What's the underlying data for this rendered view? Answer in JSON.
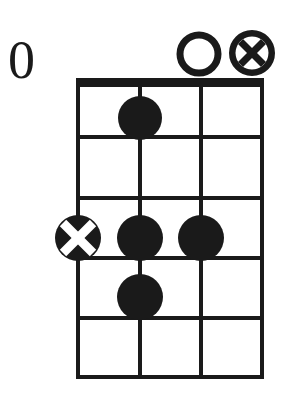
{
  "diagram": {
    "type": "chord-chart",
    "instrument_strings": 4,
    "frets_shown": 5,
    "starting_fret_label": "0",
    "colors": {
      "ink": "#1a1a1a",
      "background": "#ffffff",
      "marker_cross": "#ffffff"
    },
    "geometry": {
      "string_x": [
        78,
        140,
        201,
        262
      ],
      "fret_y": [
        86,
        137,
        198,
        258,
        318,
        378
      ],
      "nut_top": 78,
      "nut_bottom": 86,
      "dot_radius": 22,
      "open_marker_radius": 19,
      "muted_marker_radius": 20
    }
  },
  "fret_position": {
    "label": "0"
  },
  "top_markers": [
    {
      "id": "open-string-3",
      "kind": "open",
      "symbol": "O",
      "string_index": 2,
      "cx": 199,
      "cy": 54,
      "r": 19,
      "meaning": "open"
    },
    {
      "id": "muted-string-4",
      "kind": "muted",
      "symbol": "X",
      "string_index": 3,
      "cx": 252,
      "cy": 53,
      "r": 20,
      "meaning": "muted"
    }
  ],
  "finger_dots": [
    {
      "id": "dot-string2-fret1",
      "kind": "filled",
      "string_index": 1,
      "fret": 1,
      "cx": 140,
      "cy": 118,
      "r": 22
    },
    {
      "id": "dot-string1-fret3-crossed",
      "kind": "crossed",
      "string_index": 0,
      "fret": 3,
      "cx": 78,
      "cy": 238,
      "r": 23
    },
    {
      "id": "dot-string2-fret3",
      "kind": "filled",
      "string_index": 1,
      "fret": 3,
      "cx": 140,
      "cy": 238,
      "r": 23
    },
    {
      "id": "dot-string3-fret3",
      "kind": "filled",
      "string_index": 2,
      "fret": 3,
      "cx": 201,
      "cy": 238,
      "r": 23
    },
    {
      "id": "dot-string2-fret4",
      "kind": "filled",
      "string_index": 1,
      "fret": 4,
      "cx": 140,
      "cy": 297,
      "r": 23
    }
  ]
}
